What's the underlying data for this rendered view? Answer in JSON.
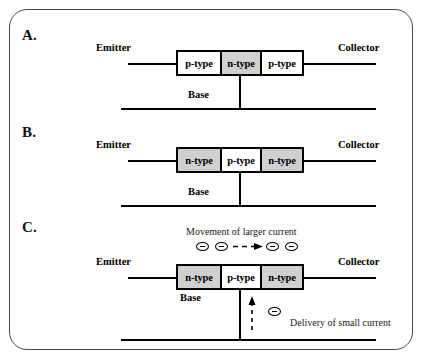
{
  "figure": {
    "background_color": "#ffffff",
    "frame_color": "#4a4a4a",
    "gray_fill": "#d0d0d0",
    "white_fill": "#ffffff",
    "line_color": "#000000"
  },
  "panels": [
    {
      "letter": "A.",
      "type": "pnp",
      "emitter_label": "Emitter",
      "collector_label": "Collector",
      "base_label": "Base",
      "segments": [
        {
          "label": "p-type",
          "fill": "white"
        },
        {
          "label": "n-type",
          "fill": "gray"
        },
        {
          "label": "p-type",
          "fill": "white"
        }
      ]
    },
    {
      "letter": "B.",
      "type": "npn",
      "emitter_label": "Emitter",
      "collector_label": "Collector",
      "base_label": "Base",
      "segments": [
        {
          "label": "n-type",
          "fill": "gray"
        },
        {
          "label": "p-type",
          "fill": "white"
        },
        {
          "label": "n-type",
          "fill": "gray"
        }
      ]
    },
    {
      "letter": "C.",
      "type": "npn-operation",
      "emitter_label": "Emitter",
      "collector_label": "Collector",
      "base_label": "Base",
      "segments": [
        {
          "label": "n-type",
          "fill": "gray"
        },
        {
          "label": "p-type",
          "fill": "white"
        },
        {
          "label": "n-type",
          "fill": "gray"
        }
      ],
      "annotations": {
        "top_current": "Movement of larger current",
        "base_current": "Delivery of small current",
        "electron_count_top": 4,
        "electron_count_base": 1,
        "top_arrow_direction": "right",
        "base_arrow_direction": "up",
        "electron_symbol": "electron-minus-icon"
      }
    }
  ]
}
